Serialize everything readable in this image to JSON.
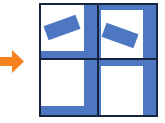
{
  "colors": {
    "arrow": "#F5821F",
    "fill": "#4E77C2",
    "line": "#16243F",
    "background": "#FFFFFF"
  },
  "diagram": {
    "arrow": {
      "icon": "right-arrow-icon",
      "direction": "right"
    },
    "grid": {
      "rows": 2,
      "cols": 2
    },
    "quadrants": [
      {
        "position": "top-left",
        "tilted_bar": true,
        "bar_angle_deg": -20,
        "edges_filled": [
          "right",
          "bottom"
        ]
      },
      {
        "position": "top-right",
        "tilted_bar": true,
        "bar_angle_deg": 20,
        "edges_filled": [
          "top",
          "left",
          "right"
        ]
      },
      {
        "position": "bottom-left",
        "tilted_bar": false,
        "edges_filled": [
          "right",
          "bottom"
        ]
      },
      {
        "position": "bottom-right",
        "tilted_bar": false,
        "edges_filled": [
          "top",
          "left",
          "right"
        ]
      }
    ]
  }
}
